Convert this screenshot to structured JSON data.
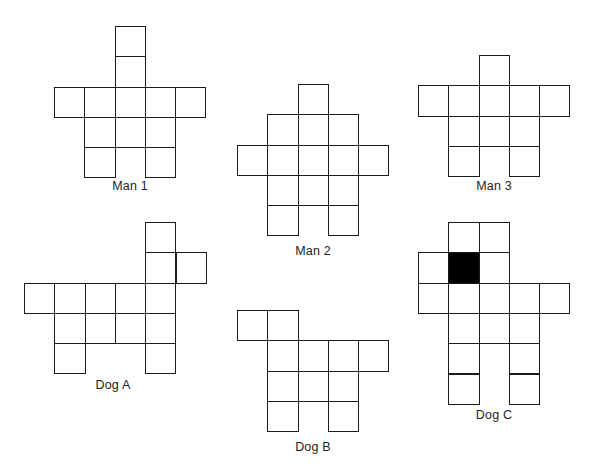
{
  "colors": {
    "background": "#ffffff",
    "line": "#1a1a1a",
    "filled": "#000000",
    "label": "#222222"
  },
  "cell_size": 30.3,
  "figures": [
    {
      "id": "man-1",
      "label": "Man 1",
      "origin": [
        54,
        26
      ],
      "label_pos": [
        130,
        186
      ],
      "cells": [
        [
          0,
          2
        ],
        [
          1,
          2
        ],
        [
          2,
          0
        ],
        [
          2,
          1
        ],
        [
          2,
          2
        ],
        [
          2,
          3
        ],
        [
          2,
          4
        ],
        [
          3,
          1
        ],
        [
          3,
          2
        ],
        [
          3,
          3
        ],
        [
          4,
          1
        ],
        [
          4,
          3
        ]
      ]
    },
    {
      "id": "man-2",
      "label": "Man 2",
      "origin": [
        237,
        84
      ],
      "label_pos": [
        313,
        251
      ],
      "cells": [
        [
          0,
          2
        ],
        [
          1,
          1
        ],
        [
          1,
          2
        ],
        [
          1,
          3
        ],
        [
          2,
          0
        ],
        [
          2,
          1
        ],
        [
          2,
          2
        ],
        [
          2,
          3
        ],
        [
          2,
          4
        ],
        [
          3,
          1
        ],
        [
          3,
          2
        ],
        [
          3,
          3
        ],
        [
          4,
          1
        ],
        [
          4,
          3
        ]
      ]
    },
    {
      "id": "man-3",
      "label": "Man 3",
      "origin": [
        418,
        55
      ],
      "label_pos": [
        494,
        186
      ],
      "cells": [
        [
          0,
          2
        ],
        [
          1,
          0
        ],
        [
          1,
          1
        ],
        [
          1,
          2
        ],
        [
          1,
          3
        ],
        [
          1,
          4
        ],
        [
          2,
          1
        ],
        [
          2,
          2
        ],
        [
          2,
          3
        ],
        [
          3,
          1
        ],
        [
          3,
          3
        ]
      ]
    },
    {
      "id": "dog-a",
      "label": "Dog A",
      "origin": [
        24,
        222
      ],
      "label_pos": [
        113,
        385
      ],
      "cells": [
        [
          0,
          4
        ],
        [
          1,
          4
        ],
        [
          1,
          5
        ],
        [
          2,
          0
        ],
        [
          2,
          1
        ],
        [
          2,
          2
        ],
        [
          2,
          3
        ],
        [
          2,
          4
        ],
        [
          3,
          1
        ],
        [
          3,
          2
        ],
        [
          3,
          3
        ],
        [
          3,
          4
        ],
        [
          4,
          1
        ],
        [
          4,
          4
        ]
      ]
    },
    {
      "id": "dog-b",
      "label": "Dog B",
      "origin": [
        237,
        310
      ],
      "label_pos": [
        313,
        447
      ],
      "cells": [
        [
          0,
          0
        ],
        [
          0,
          1
        ],
        [
          1,
          1
        ],
        [
          1,
          2
        ],
        [
          1,
          3
        ],
        [
          1,
          4
        ],
        [
          2,
          1
        ],
        [
          2,
          2
        ],
        [
          2,
          3
        ],
        [
          3,
          1
        ],
        [
          3,
          3
        ]
      ]
    },
    {
      "id": "dog-c",
      "label": "Dog C",
      "origin": [
        418,
        222
      ],
      "label_pos": [
        494,
        415
      ],
      "cells": [
        [
          0,
          1
        ],
        [
          0,
          2
        ],
        [
          1,
          0
        ],
        [
          1,
          1,
          "filled"
        ],
        [
          1,
          2
        ],
        [
          2,
          0
        ],
        [
          2,
          1
        ],
        [
          2,
          2
        ],
        [
          2,
          3
        ],
        [
          2,
          4
        ],
        [
          3,
          1
        ],
        [
          3,
          2
        ],
        [
          3,
          3
        ],
        [
          4,
          1
        ],
        [
          4,
          3
        ],
        [
          5,
          1
        ],
        [
          5,
          3
        ]
      ]
    }
  ]
}
